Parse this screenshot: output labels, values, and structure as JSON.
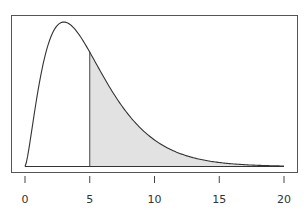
{
  "chart_data": {
    "type": "area",
    "title": "",
    "xlabel": "",
    "ylabel": "",
    "distribution": "chi-square density (df approx. 5)",
    "xlim": [
      0,
      20
    ],
    "ticks": [
      0,
      5,
      10,
      15,
      20
    ],
    "tick_labels": [
      "0",
      "5",
      "10",
      "15",
      "20"
    ],
    "shaded_region": {
      "from": 5,
      "to": 20,
      "color": "#e2e2e2"
    },
    "cutoff_line_x": 5,
    "curve_points": [
      {
        "x": 0,
        "y": 0.0
      },
      {
        "x": 1,
        "y": 0.08
      },
      {
        "x": 2,
        "y": 0.138
      },
      {
        "x": 3,
        "y": 0.154
      },
      {
        "x": 4,
        "y": 0.144
      },
      {
        "x": 5,
        "y": 0.122
      },
      {
        "x": 6,
        "y": 0.096
      },
      {
        "x": 7,
        "y": 0.073
      },
      {
        "x": 8,
        "y": 0.053
      },
      {
        "x": 9,
        "y": 0.038
      },
      {
        "x": 10,
        "y": 0.027
      },
      {
        "x": 12,
        "y": 0.012
      },
      {
        "x": 14,
        "y": 0.005
      },
      {
        "x": 16,
        "y": 0.002
      },
      {
        "x": 18,
        "y": 0.001
      },
      {
        "x": 20,
        "y": 0.0003
      }
    ],
    "grid": false,
    "legend": null
  }
}
